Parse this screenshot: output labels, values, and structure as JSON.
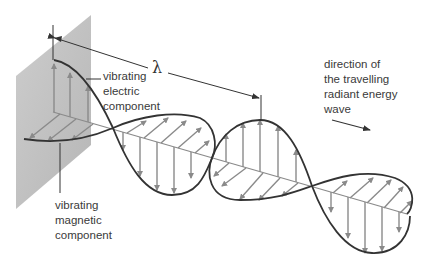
{
  "diagram": {
    "labels": {
      "electric": [
        "vibrating",
        "electric",
        "component"
      ],
      "magnetic": [
        "vibrating",
        "magnetic",
        "component"
      ],
      "direction": [
        "direction of",
        "the travelling",
        "radiant energy",
        "wave"
      ],
      "wavelength_symbol": "λ"
    },
    "colors": {
      "plane": "#b8b8b8",
      "curve": "#333333",
      "vector": "#8a8a8a",
      "text": "#3a3a3a"
    }
  }
}
